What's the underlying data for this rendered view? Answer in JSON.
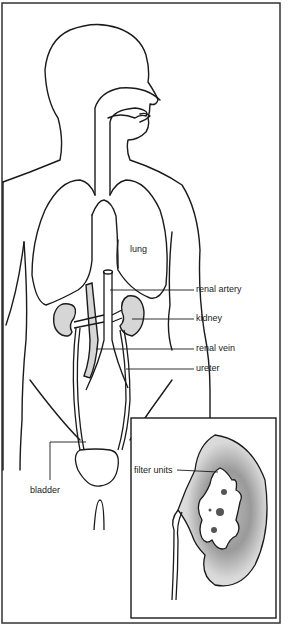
{
  "diagram": {
    "colors": {
      "line": "#1a1a1a",
      "organ_fill": "#d6d6d6",
      "background": "#ffffff"
    },
    "labels": {
      "lung": "lung",
      "renal_artery": "renal artery",
      "kidney": "kidney",
      "renal_vein": "renal vein",
      "ureter": "ureter",
      "bladder": "bladder",
      "filter_units": "filter units"
    }
  }
}
